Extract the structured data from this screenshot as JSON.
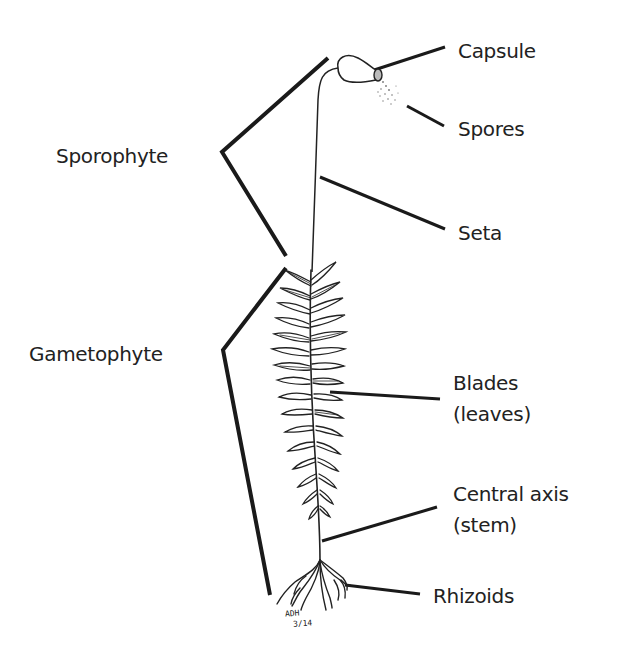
{
  "diagram": {
    "labels": {
      "capsule": "Capsule",
      "spores": "Spores",
      "sporophyte": "Sporophyte",
      "seta": "Seta",
      "gametophyte": "Gametophyte",
      "blades_line1": "Blades",
      "blades_line2": "(leaves)",
      "central_axis_line1": "Central axis",
      "central_axis_line2": "(stem)",
      "rhizoids": "Rhizoids"
    },
    "signature": {
      "line1": "ADH",
      "line2": "3/14"
    },
    "colors": {
      "line": "#1a1a1a",
      "text": "#222222",
      "background": "#ffffff"
    }
  }
}
